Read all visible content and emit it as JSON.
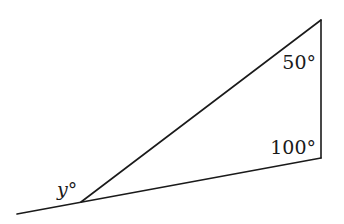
{
  "diagram": {
    "type": "geometry-triangle",
    "vertices": {
      "left": {
        "x": 81,
        "y": 202
      },
      "top": {
        "x": 321,
        "y": 20
      },
      "bottom_right": {
        "x": 321,
        "y": 158
      }
    },
    "extension_start": {
      "x": 17,
      "y": 214
    },
    "labels": {
      "top_angle": "50°",
      "right_angle": "100°",
      "exterior_angle": "y°"
    },
    "label_positions": {
      "top_angle": {
        "x": 316,
        "y": 69
      },
      "right_angle": {
        "x": 316,
        "y": 154
      },
      "exterior_angle": {
        "x": 57,
        "y": 196
      }
    },
    "colors": {
      "stroke": "#1a1a1a",
      "background": "#ffffff"
    }
  }
}
